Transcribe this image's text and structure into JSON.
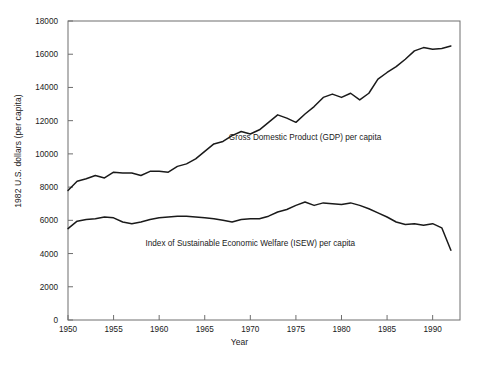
{
  "chart_data": {
    "type": "line",
    "title": "",
    "xlabel": "Year",
    "ylabel": "1982 U.S. dollars (per capita)",
    "xlim": [
      1950,
      1993
    ],
    "ylim": [
      0,
      18000
    ],
    "xticks": [
      1950,
      1955,
      1960,
      1965,
      1970,
      1975,
      1980,
      1985,
      1990
    ],
    "yticks": [
      0,
      2000,
      4000,
      6000,
      8000,
      10000,
      12000,
      14000,
      16000,
      18000
    ],
    "grid": false,
    "legend_position": "inline-annotation",
    "x": [
      1950,
      1951,
      1952,
      1953,
      1954,
      1955,
      1956,
      1957,
      1958,
      1959,
      1960,
      1961,
      1962,
      1963,
      1964,
      1965,
      1966,
      1967,
      1968,
      1969,
      1970,
      1971,
      1972,
      1973,
      1974,
      1975,
      1976,
      1977,
      1978,
      1979,
      1980,
      1981,
      1982,
      1983,
      1984,
      1985,
      1986,
      1987,
      1988,
      1989,
      1990,
      1991,
      1992
    ],
    "series": [
      {
        "name": "Gross Domestic Product (GDP) per capita",
        "label": "Gross Domestic Product (GDP) per capita",
        "color": "#1a1a1a",
        "values": [
          7800,
          8350,
          8500,
          8700,
          8550,
          8900,
          8850,
          8850,
          8700,
          8950,
          8950,
          8900,
          9250,
          9400,
          9700,
          10150,
          10600,
          10750,
          11100,
          11350,
          11200,
          11450,
          11900,
          12350,
          12150,
          11900,
          12400,
          12850,
          13400,
          13600,
          13400,
          13650,
          13250,
          13650,
          14500,
          14900,
          15250,
          15700,
          16200,
          16400,
          16300,
          16350,
          16500
        ]
      },
      {
        "name": "Index of Sustainable Economic Welfare (ISEW) per capita",
        "label": "Index of Sustainable Economic Welfare (ISEW) per capita",
        "color": "#1a1a1a",
        "values": [
          5500,
          5950,
          6050,
          6100,
          6200,
          6150,
          5900,
          5800,
          5900,
          6050,
          6150,
          6200,
          6250,
          6250,
          6200,
          6150,
          6100,
          6000,
          5900,
          6050,
          6100,
          6100,
          6250,
          6500,
          6650,
          6900,
          7100,
          6900,
          7050,
          7000,
          6950,
          7050,
          6900,
          6700,
          6450,
          6200,
          5900,
          5750,
          5800,
          5700,
          5800,
          5550,
          4200
        ]
      }
    ],
    "annotations": [
      {
        "text": "Gross Domestic Product (GDP) per capita",
        "x": 1976,
        "y": 11000
      },
      {
        "text": "Index of Sustainable Economic Welfare (ISEW) per capita",
        "x": 1970,
        "y": 4650
      }
    ]
  }
}
